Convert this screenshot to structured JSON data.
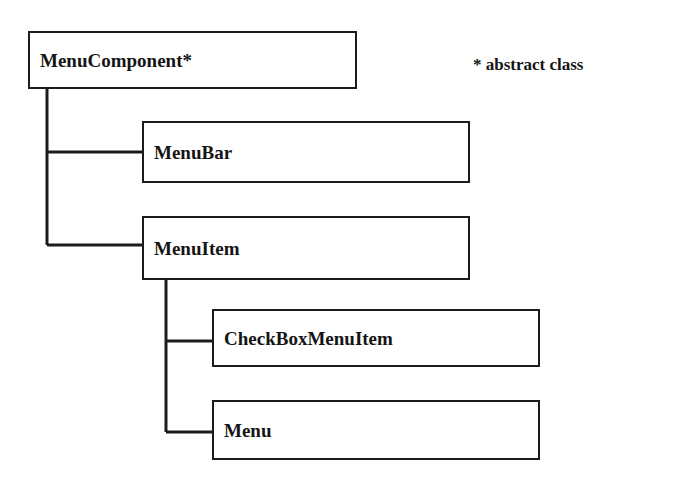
{
  "diagram": {
    "background_color": "#ffffff",
    "line_color": "#1c1c1c",
    "text_color": "#151515",
    "canvas": {
      "width": 681,
      "height": 503
    }
  },
  "legend": {
    "marker": "*",
    "text": "* abstract class",
    "x": 473,
    "y": 56,
    "font_size": 17
  },
  "boxes": [
    {
      "id": "menucomponent",
      "label": "MenuComponent*",
      "abstract": true,
      "x": 28,
      "y": 31,
      "width": 329,
      "height": 58,
      "font_size": 19,
      "text_pad_left": 10
    },
    {
      "id": "menubar",
      "label": "MenuBar",
      "abstract": false,
      "x": 142,
      "y": 121,
      "width": 328,
      "height": 62,
      "font_size": 19,
      "text_pad_left": 10
    },
    {
      "id": "menuitem",
      "label": "MenuItem",
      "abstract": false,
      "x": 142,
      "y": 216,
      "width": 328,
      "height": 64,
      "font_size": 19,
      "text_pad_left": 10
    },
    {
      "id": "checkboxmenuitem",
      "label": "CheckBoxMenuItem",
      "abstract": false,
      "x": 212,
      "y": 309,
      "width": 328,
      "height": 58,
      "font_size": 19,
      "text_pad_left": 10
    },
    {
      "id": "menu",
      "label": "Menu",
      "abstract": false,
      "x": 212,
      "y": 400,
      "width": 328,
      "height": 60,
      "font_size": 19,
      "text_pad_left": 10
    }
  ],
  "connections": [
    {
      "id": "menucomponent-to-menubar",
      "from": "menucomponent",
      "to": "menubar"
    },
    {
      "id": "menucomponent-to-menuitem",
      "from": "menucomponent",
      "to": "menuitem"
    },
    {
      "id": "menuitem-to-checkboxmenuitem",
      "from": "menuitem",
      "to": "checkboxmenuitem"
    },
    {
      "id": "menuitem-to-menu",
      "from": "menuitem",
      "to": "menu"
    }
  ]
}
